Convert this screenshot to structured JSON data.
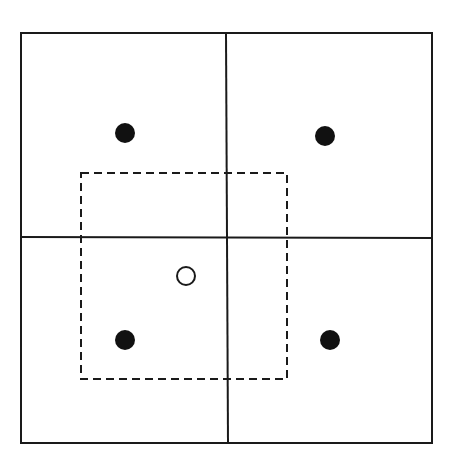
{
  "diagram": {
    "colors": {
      "background": "#ffffff",
      "stroke": "#1a1a1a",
      "fill": "#111111"
    },
    "outer_box": {
      "x": 21,
      "y": 33,
      "width": 411,
      "height": 410
    },
    "dividers": {
      "vertical": {
        "x1": 226,
        "y1": 33,
        "x2": 228,
        "y2": 443
      },
      "horizontal": {
        "x1": 21,
        "y1": 237,
        "x2": 432,
        "y2": 238
      }
    },
    "dashed_window": {
      "x": 81,
      "y": 173,
      "width": 206,
      "height": 206
    },
    "filled_points": [
      {
        "cx": 125,
        "cy": 133,
        "r": 10
      },
      {
        "cx": 325,
        "cy": 136,
        "r": 10
      },
      {
        "cx": 125,
        "cy": 340,
        "r": 10
      },
      {
        "cx": 330,
        "cy": 340,
        "r": 10
      }
    ],
    "hollow_point": {
      "cx": 186,
      "cy": 276,
      "r": 9
    }
  }
}
